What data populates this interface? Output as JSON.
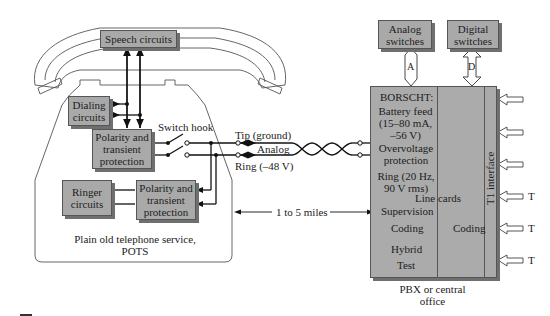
{
  "diagram": {
    "pots": {
      "speech": "Speech circuits",
      "dialing": [
        "Dialing",
        "circuits"
      ],
      "polarity1": [
        "Polarity and",
        "transient",
        "protection"
      ],
      "polarity2": [
        "Polarity and",
        "transient",
        "protection"
      ],
      "ringer": [
        "Ringer",
        "circuits"
      ],
      "switch_hook": "Switch hook",
      "caption": [
        "Plain old telephone service,",
        "POTS"
      ]
    },
    "line": {
      "tip": "Tip (ground)",
      "analog": "Analog",
      "ring": "Ring (–48 V)",
      "distance": "1 to 5 miles"
    },
    "switches": {
      "analog": [
        "Analog",
        "switches"
      ],
      "digital": [
        "Digital",
        "switches"
      ],
      "a_label": "A",
      "d_label": "D"
    },
    "pbx": {
      "borscht": "BORSCHT:",
      "battery": [
        "Battery feed",
        "(15–80 mA,",
        "–56 V)"
      ],
      "overvoltage": [
        "Overvoltage",
        "protection"
      ],
      "ring": [
        "Ring (20 Hz,",
        "90 V rms)"
      ],
      "line_cards": "Line cards",
      "supervision": "Supervision",
      "coding_left": "Coding",
      "coding_right": "Coding",
      "hybrid": "Hybrid",
      "test": "Test",
      "t1": "T1 interface",
      "t_labels": [
        "T",
        "T",
        "T"
      ],
      "caption": [
        "PBX or central",
        "office"
      ]
    }
  }
}
